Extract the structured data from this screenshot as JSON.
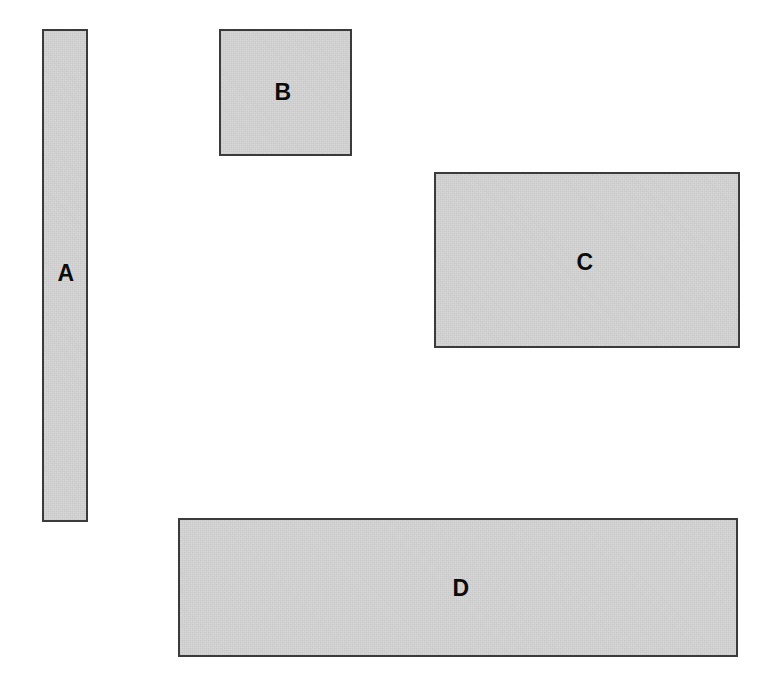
{
  "figure": {
    "canvas_width": 775,
    "canvas_height": 696,
    "background_color": "#ffffff",
    "fill_color": "#d5d5d5",
    "border_color": "#3b3b3b",
    "label_color": "#0b0b0b"
  },
  "chart_data": {
    "type": "diagram",
    "xlabel": "",
    "ylabel": "",
    "units": "pixels",
    "categories": [
      "A",
      "B",
      "C",
      "D"
    ],
    "shapes": [
      {
        "label": "A",
        "x": 42,
        "y": 29,
        "width": 46,
        "height": 493,
        "area": 22678,
        "aspect": "tall-narrow-vertical-bar",
        "label_x": 66,
        "label_y": 273,
        "fill": "#d5d5d5",
        "stroke": "#3b3b3b"
      },
      {
        "label": "B",
        "x": 219,
        "y": 29,
        "width": 133,
        "height": 127,
        "area": 16891,
        "aspect": "near-square",
        "label_x": 283,
        "label_y": 92,
        "fill": "#d5d5d5",
        "stroke": "#3b3b3b"
      },
      {
        "label": "C",
        "x": 434,
        "y": 172,
        "width": 306,
        "height": 176,
        "area": 53856,
        "aspect": "wide-landscape",
        "label_x": 585,
        "label_y": 262,
        "fill": "#d5d5d5",
        "stroke": "#3b3b3b"
      },
      {
        "label": "D",
        "x": 178,
        "y": 518,
        "width": 560,
        "height": 139,
        "area": 77840,
        "aspect": "very-wide-horizontal-bar",
        "label_x": 461,
        "label_y": 588,
        "fill": "#d5d5d5",
        "stroke": "#3b3b3b"
      }
    ]
  }
}
